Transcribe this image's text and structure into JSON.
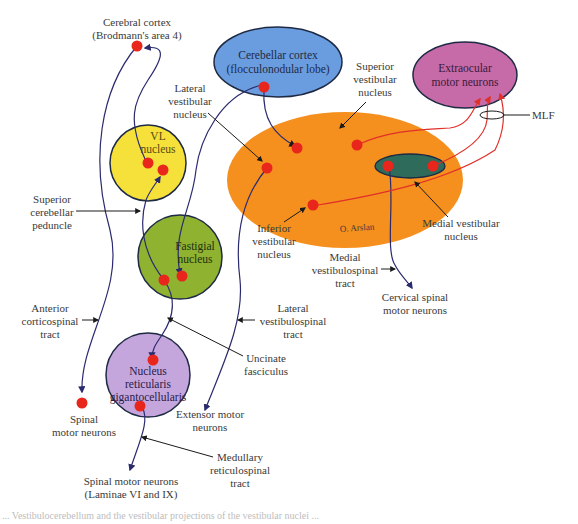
{
  "colors": {
    "cerebellar_cortex": "#6a9de0",
    "extraocular": "#c66aa8",
    "vestibular_complex": "#f5901e",
    "medial_vestibular": "#2f6b5b",
    "vl_nucleus": "#f6e03a",
    "fastigial": "#8fb231",
    "reticularis": "#c4a6dc",
    "neuron_dot": "#e8261b",
    "tract_blue": "#2a2a6e",
    "tract_red": "#e0302a",
    "outline": "#1e2a44",
    "label_text": "#3a3a3a"
  },
  "structures": {
    "cerebellar_cortex": {
      "line1": "Cerebellar cortex",
      "line2": "(flocculonodular lobe)"
    },
    "extraocular": {
      "line1": "Extraocular",
      "line2": "motor neurons"
    },
    "vl_nucleus": {
      "line1": "VL",
      "line2": "nucleus"
    },
    "fastigial": {
      "line1": "Fastigial",
      "line2": "nucleus"
    },
    "reticularis": {
      "line1": "Nucleus",
      "line2": "reticularis",
      "line3": "gigantocellularis"
    }
  },
  "labels": {
    "cerebral_cortex": {
      "line1": "Cerebral cortex",
      "line2": "(Brodmann's area 4)"
    },
    "lateral_vestibular_nucleus": {
      "line1": "Lateral",
      "line2": "vestibular",
      "line3": "nucleus"
    },
    "superior_vestibular_nucleus": {
      "line1": "Superior",
      "line2": "vestibular",
      "line3": "nucleus"
    },
    "mlf": "MLF",
    "superior_cerebellar_peduncle": {
      "line1": "Superior",
      "line2": "cerebellar",
      "line3": "peduncle"
    },
    "inferior_vestibular_nucleus": {
      "line1": "Inferior",
      "line2": "vestibular",
      "line3": "nucleus"
    },
    "signature": "O. Arslan",
    "medial_vestibular_nucleus": {
      "line1": "Medial vestibular",
      "line2": "nucleus"
    },
    "medial_vestibulospinal_tract": {
      "line1": "Medial",
      "line2": "vestibulospinal",
      "line3": "tract"
    },
    "cervical_spinal_motor_neurons": {
      "line1": "Cervical spinal",
      "line2": "motor neurons"
    },
    "anterior_corticospinal_tract": {
      "line1": "Anterior",
      "line2": "corticospinal",
      "line3": "tract"
    },
    "lateral_vestibulospinal_tract": {
      "line1": "Lateral",
      "line2": "vestibulospinal",
      "line3": "tract"
    },
    "uncinate_fasciculus": {
      "line1": "Uncinate",
      "line2": "fasciculus"
    },
    "spinal_motor_neurons": {
      "line1": "Spinal",
      "line2": "motor neurons"
    },
    "extensor_motor_neurons": {
      "line1": "Extensor motor",
      "line2": "neurons"
    },
    "medullary_reticulospinal_tract": {
      "line1": "Medullary",
      "line2": "reticulospinal",
      "line3": "tract"
    },
    "spinal_motor_neurons_laminae": {
      "line1": "Spinal motor neurons",
      "line2": "(Laminae VI and IX)"
    }
  },
  "caption": "... Vestibulocerebellum and the vestibular projections of the vestibular nuclei ..."
}
